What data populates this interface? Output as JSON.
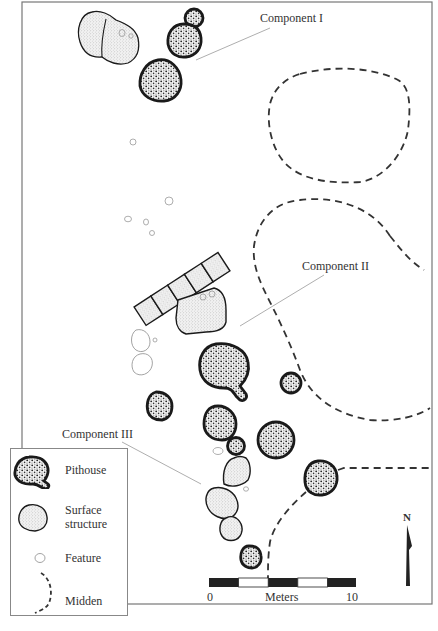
{
  "map": {
    "labels": {
      "component_1": "Component I",
      "component_2": "Component II",
      "component_3": "Component III"
    },
    "legend": {
      "items": [
        {
          "symbol": "pithouse-icon",
          "label": "Pithouse"
        },
        {
          "symbol": "surface-structure-icon",
          "label": "Surface structure",
          "line1": "Surface",
          "line2": "structure"
        },
        {
          "symbol": "feature-icon",
          "label": "Feature"
        },
        {
          "symbol": "midden-icon",
          "label": "Midden"
        }
      ]
    },
    "scale_bar": {
      "start_label": "0",
      "unit_label": "Meters",
      "end_label": "10",
      "segments": 5,
      "colors": [
        "#222222",
        "#ffffff",
        "#222222",
        "#ffffff",
        "#222222"
      ]
    },
    "north_arrow": {
      "label": "N"
    },
    "colors": {
      "frame": "#777777",
      "outline": "#1a1a1a",
      "pithouse_fill": "#d8d8d8",
      "surface_fill": "#ebebeb",
      "feature_stroke": "#999999",
      "leader_line": "#999999",
      "midden_stroke": "#333333"
    }
  }
}
